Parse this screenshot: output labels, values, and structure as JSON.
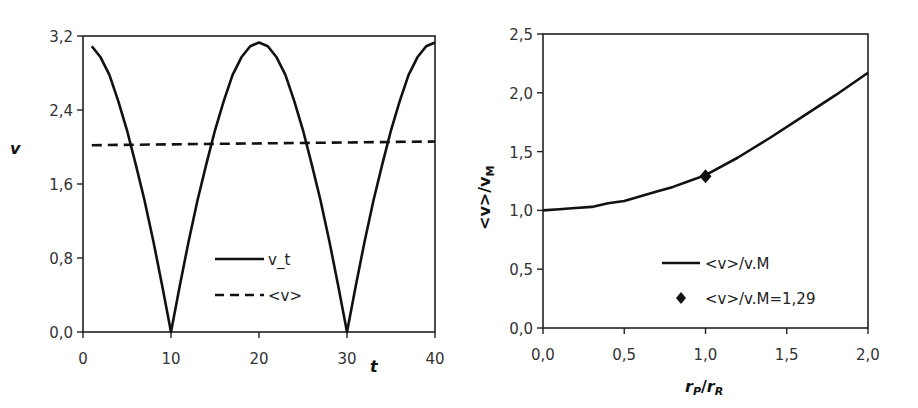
{
  "chart_data": [
    {
      "type": "line",
      "title": "",
      "xlabel": "t",
      "ylabel": "v",
      "xlim": [
        0,
        40
      ],
      "ylim": [
        0.0,
        3.2
      ],
      "grid": false,
      "legend_position": "inside-lower-center",
      "x_ticks": [
        "0",
        "10",
        "20",
        "30",
        "40"
      ],
      "y_ticks": [
        "0,0",
        "0,8",
        "1,6",
        "2,4",
        "3,2"
      ],
      "series": [
        {
          "name": "v_t",
          "style": "solid",
          "x": [
            1,
            2,
            3,
            4,
            5,
            6,
            7,
            8,
            9,
            10,
            11,
            12,
            13,
            14,
            15,
            16,
            17,
            18,
            19,
            20,
            21,
            22,
            23,
            24,
            25,
            26,
            27,
            28,
            29,
            30,
            31,
            32,
            33,
            34,
            35,
            36,
            37,
            38,
            39,
            40
          ],
          "values": [
            3.09,
            2.97,
            2.78,
            2.5,
            2.18,
            1.81,
            1.42,
            0.98,
            0.5,
            0.0,
            0.5,
            0.98,
            1.42,
            1.81,
            2.18,
            2.5,
            2.78,
            2.97,
            3.09,
            3.13,
            3.09,
            2.97,
            2.78,
            2.5,
            2.18,
            1.81,
            1.42,
            0.98,
            0.5,
            0.0,
            0.5,
            0.98,
            1.42,
            1.81,
            2.18,
            2.5,
            2.78,
            2.97,
            3.09,
            3.13
          ]
        },
        {
          "name": "<v>",
          "style": "dashed",
          "x": [
            1,
            40
          ],
          "values": [
            2.02,
            2.06
          ]
        }
      ]
    },
    {
      "type": "line",
      "title": "",
      "xlabel": "rP/rR",
      "ylabel": "<v>/vM",
      "xlim": [
        0.0,
        2.0
      ],
      "ylim": [
        0.0,
        2.5
      ],
      "grid": false,
      "legend_position": "inside-lower-right",
      "x_ticks": [
        "0,0",
        "0,5",
        "1,0",
        "1,5",
        "2,0"
      ],
      "y_ticks": [
        "0,0",
        "0,5",
        "1,0",
        "1,5",
        "2,0",
        "2,5"
      ],
      "series": [
        {
          "name": "<v>/v.M",
          "style": "solid",
          "x": [
            0.0,
            0.1,
            0.2,
            0.3,
            0.4,
            0.5,
            0.6,
            0.7,
            0.8,
            0.9,
            1.0,
            1.2,
            1.4,
            1.6,
            1.8,
            2.0
          ],
          "values": [
            1.0,
            1.01,
            1.02,
            1.03,
            1.06,
            1.08,
            1.12,
            1.16,
            1.2,
            1.25,
            1.3,
            1.45,
            1.62,
            1.8,
            1.98,
            2.17
          ]
        },
        {
          "name": "<v>/v.M=1,29",
          "style": "marker-diamond",
          "x": [
            1.0
          ],
          "values": [
            1.29
          ]
        }
      ]
    }
  ],
  "left_chart": {
    "y_axis_title": "v",
    "x_axis_title": "t",
    "y_ticks": [
      {
        "label": "3,2",
        "value": 3.2
      },
      {
        "label": "2,4",
        "value": 2.4
      },
      {
        "label": "1,6",
        "value": 1.6
      },
      {
        "label": "0,8",
        "value": 0.8
      },
      {
        "label": "0,0",
        "value": 0.0
      }
    ],
    "x_ticks": [
      {
        "label": "0",
        "value": 0
      },
      {
        "label": "10",
        "value": 10
      },
      {
        "label": "20",
        "value": 20
      },
      {
        "label": "30",
        "value": 30
      },
      {
        "label": "40",
        "value": 40
      }
    ],
    "legend": [
      {
        "label": "v_t",
        "style": "solid"
      },
      {
        "label": "<v>",
        "style": "dashed"
      }
    ]
  },
  "right_chart": {
    "y_axis_title_main": "<v>/v",
    "y_axis_title_sub": "M",
    "x_axis_title_r1": "r",
    "x_axis_title_r1_sub": "P",
    "x_axis_title_sep": "/",
    "x_axis_title_r2": "r",
    "x_axis_title_r2_sub": "R",
    "y_ticks": [
      {
        "label": "2,5",
        "value": 2.5
      },
      {
        "label": "2,0",
        "value": 2.0
      },
      {
        "label": "1,5",
        "value": 1.5
      },
      {
        "label": "1,0",
        "value": 1.0
      },
      {
        "label": "0,5",
        "value": 0.5
      },
      {
        "label": "0,0",
        "value": 0.0
      }
    ],
    "x_ticks": [
      {
        "label": "0,0",
        "value": 0.0
      },
      {
        "label": "0,5",
        "value": 0.5
      },
      {
        "label": "1,0",
        "value": 1.0
      },
      {
        "label": "1,5",
        "value": 1.5
      },
      {
        "label": "2,0",
        "value": 2.0
      }
    ],
    "legend": [
      {
        "label": "<v>/v.M",
        "style": "solid"
      },
      {
        "label": "<v>/v.M=1,29",
        "style": "diamond"
      }
    ]
  },
  "colors": {
    "line": "#111111",
    "axis": "#222222",
    "text": "#333333",
    "background": "#ffffff"
  }
}
